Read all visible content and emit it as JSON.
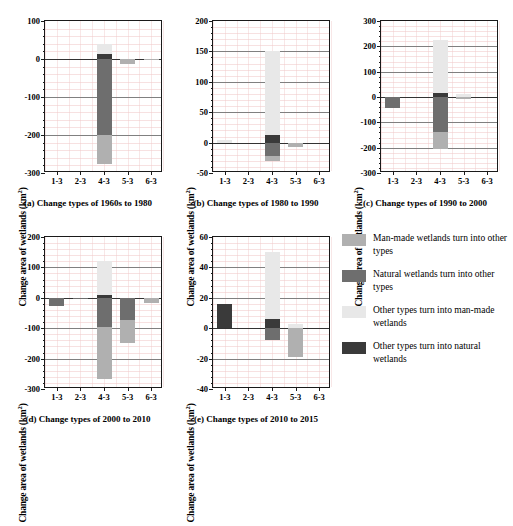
{
  "axis_title": "Change area of wetlands (km",
  "axis_title_sup": "2",
  "axis_title_end": ")",
  "categories": [
    "1-3",
    "2-3",
    "4-3",
    "5-3",
    "6-3"
  ],
  "colors": {
    "manmade_to_other": "#b0b0b0",
    "natural_to_other": "#6e6e6e",
    "other_to_manmade": "#e8e8e8",
    "other_to_natural": "#3a3a3a",
    "axis": "#1a1a1a",
    "gridline": "#808080",
    "minor_grid": "#f0c9c9"
  },
  "legend": {
    "items": [
      {
        "key": "manmade_to_other",
        "color": "#b0b0b0",
        "label": "Man-made wetlands turn into other types"
      },
      {
        "key": "natural_to_other",
        "color": "#6e6e6e",
        "label": "Natural wetlands turn into other types"
      },
      {
        "key": "other_to_manmade",
        "color": "#e8e8e8",
        "label": "Other types turn into man-made wetlands"
      },
      {
        "key": "other_to_natural",
        "color": "#3a3a3a",
        "label": "Other types turn into natural wetlands"
      }
    ]
  },
  "chart_data": [
    {
      "id": "a",
      "type": "bar",
      "title": "(a) Change types of 1960s to 1980",
      "ylabel": "Change area of wetlands (km2)",
      "xlabel": "",
      "ylim": [
        -300,
        100
      ],
      "yticks": [
        -300,
        -200,
        -100,
        0,
        100
      ],
      "categories": [
        "1-3",
        "2-3",
        "4-3",
        "5-3",
        "6-3"
      ],
      "grid": true,
      "series": [
        {
          "name": "Man-made wetlands turn into other types",
          "color": "#b0b0b0",
          "values": [
            0,
            0,
            -75,
            -14,
            -2
          ]
        },
        {
          "name": "Natural wetlands turn into other types",
          "color": "#6e6e6e",
          "values": [
            0,
            0,
            -200,
            0,
            0
          ]
        },
        {
          "name": "Other types turn into man-made wetlands",
          "color": "#e8e8e8",
          "values": [
            0,
            0,
            28,
            0,
            0
          ]
        },
        {
          "name": "Other types turn into natural wetlands",
          "color": "#3a3a3a",
          "values": [
            0,
            0,
            12,
            0,
            1
          ]
        }
      ]
    },
    {
      "id": "b",
      "type": "bar",
      "title": "(b) Change types of 1980 to 1990",
      "ylabel": "Change area of wetlands (km2)",
      "xlabel": "",
      "ylim": [
        -50,
        200
      ],
      "yticks": [
        -50,
        0,
        50,
        100,
        150,
        200
      ],
      "categories": [
        "1-3",
        "2-3",
        "4-3",
        "5-3",
        "6-3"
      ],
      "grid": true,
      "series": [
        {
          "name": "Man-made wetlands turn into other types",
          "color": "#b0b0b0",
          "values": [
            0,
            0,
            -8,
            -7,
            0
          ]
        },
        {
          "name": "Natural wetlands turn into other types",
          "color": "#6e6e6e",
          "values": [
            0,
            0,
            -22,
            0,
            0
          ]
        },
        {
          "name": "Other types turn into man-made wetlands",
          "color": "#e8e8e8",
          "values": [
            5,
            0,
            137,
            0,
            0
          ]
        },
        {
          "name": "Other types turn into natural wetlands",
          "color": "#3a3a3a",
          "values": [
            0,
            0,
            13,
            0,
            0
          ]
        }
      ]
    },
    {
      "id": "c",
      "type": "bar",
      "title": "(c) Change types of 1990 to 2000",
      "ylabel": "Change area of wetlands (km2)",
      "xlabel": "",
      "ylim": [
        -300,
        300
      ],
      "yticks": [
        -300,
        -200,
        -100,
        0,
        100,
        200,
        300
      ],
      "categories": [
        "1-3",
        "2-3",
        "4-3",
        "5-3",
        "6-3"
      ],
      "grid": true,
      "series": [
        {
          "name": "Man-made wetlands turn into other types",
          "color": "#b0b0b0",
          "values": [
            0,
            0,
            -65,
            -9,
            0
          ]
        },
        {
          "name": "Natural wetlands turn into other types",
          "color": "#6e6e6e",
          "values": [
            -42,
            0,
            -140,
            0,
            0
          ]
        },
        {
          "name": "Other types turn into man-made wetlands",
          "color": "#e8e8e8",
          "values": [
            0,
            0,
            210,
            12,
            0
          ]
        },
        {
          "name": "Other types turn into natural wetlands",
          "color": "#3a3a3a",
          "values": [
            0,
            0,
            15,
            0,
            0
          ]
        }
      ]
    },
    {
      "id": "d",
      "type": "bar",
      "title": "(d) Change types of 2000 to 2010",
      "ylabel": "Change area of wetlands (km2)",
      "xlabel": "",
      "ylim": [
        -300,
        200
      ],
      "yticks": [
        -300,
        -200,
        -100,
        0,
        100,
        200
      ],
      "categories": [
        "1-3",
        "2-3",
        "4-3",
        "5-3",
        "6-3"
      ],
      "grid": true,
      "series": [
        {
          "name": "Man-made wetlands turn into other types",
          "color": "#b0b0b0",
          "values": [
            0,
            0,
            -173,
            -76,
            -18
          ]
        },
        {
          "name": "Natural wetlands turn into other types",
          "color": "#6e6e6e",
          "values": [
            -28,
            -5,
            -95,
            -72,
            0
          ]
        },
        {
          "name": "Other types turn into man-made wetlands",
          "color": "#e8e8e8",
          "values": [
            0,
            0,
            112,
            0,
            0
          ]
        },
        {
          "name": "Other types turn into natural wetlands",
          "color": "#3a3a3a",
          "values": [
            0,
            0,
            8,
            0,
            0
          ]
        }
      ]
    },
    {
      "id": "e",
      "type": "bar",
      "title": "(e) Change types of 2010 to 2015",
      "ylabel": "Change area of wetlands (km2)",
      "xlabel": "",
      "ylim": [
        -40,
        60
      ],
      "yticks": [
        -40,
        -20,
        0,
        20,
        40,
        60
      ],
      "categories": [
        "1-3",
        "2-3",
        "4-3",
        "5-3",
        "6-3"
      ],
      "grid": true,
      "series": [
        {
          "name": "Man-made wetlands turn into other types",
          "color": "#b0b0b0",
          "values": [
            0,
            0,
            0,
            -19,
            0
          ]
        },
        {
          "name": "Natural wetlands turn into other types",
          "color": "#6e6e6e",
          "values": [
            0,
            0,
            -8,
            0,
            0
          ]
        },
        {
          "name": "Other types turn into man-made wetlands",
          "color": "#e8e8e8",
          "values": [
            0,
            0,
            44,
            3,
            0
          ]
        },
        {
          "name": "Other types turn into natural wetlands",
          "color": "#3a3a3a",
          "values": [
            16,
            0,
            6,
            0,
            0
          ]
        }
      ]
    }
  ]
}
